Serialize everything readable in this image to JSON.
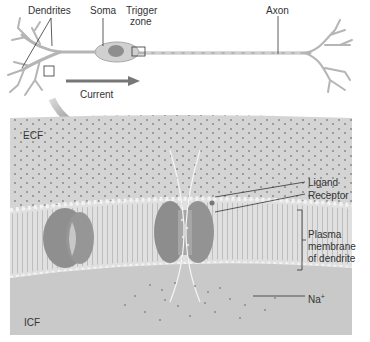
{
  "neuron": {
    "labels": {
      "dendrites": "Dendrites",
      "soma": "Soma",
      "trigger_zone_line1": "Trigger",
      "trigger_zone_line2": "zone",
      "axon": "Axon",
      "current": "Current"
    }
  },
  "detail": {
    "labels": {
      "ecf": "ECF",
      "icf": "ICF",
      "ligand": "Ligand",
      "receptor": "Receptor",
      "membrane_line1": "Plasma",
      "membrane_line2": "membrane",
      "membrane_line3": "of dendrite",
      "na": "Na",
      "na_charge": "+"
    }
  },
  "colors": {
    "neuron": "#b9b9b9",
    "arrow": "#6e6e6e",
    "fluid": "#d2d2d2",
    "icf": "#cacaca",
    "membrane": "#e4e4e4",
    "channel": "#8d8d8d"
  }
}
